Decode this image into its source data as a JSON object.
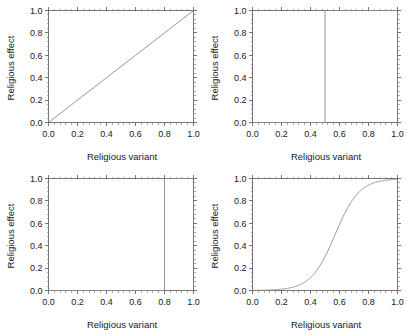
{
  "figure": {
    "background": "#ffffff",
    "line_color": "#8a8a8a",
    "axis_color": "#555555",
    "rows": 2,
    "columns": 2
  },
  "axes": {
    "xlabel": "Religious variant",
    "ylabel": "Religious effect",
    "xticklabels": [
      "0.0",
      "0.2",
      "0.4",
      "0.6",
      "0.8",
      "1.0"
    ],
    "yticklabels": [
      "0.0",
      "0.2",
      "0.4",
      "0.6",
      "0.8",
      "1.0"
    ],
    "xticks": [
      0.0,
      0.2,
      0.4,
      0.6,
      0.8,
      1.0
    ],
    "yticks": [
      0.0,
      0.2,
      0.4,
      0.6,
      0.8,
      1.0
    ],
    "xlim": [
      0.0,
      1.0
    ],
    "ylim": [
      0.0,
      1.0
    ],
    "minor_ticks_per_interval": 4,
    "tick_direction": "out",
    "frame": "full-box",
    "grid": false
  },
  "chart_data": [
    {
      "type": "line",
      "panel": "top-left",
      "title": "",
      "xlabel": "Religious variant",
      "ylabel": "Religious effect",
      "xlim": [
        0.0,
        1.0
      ],
      "ylim": [
        0.0,
        1.0
      ],
      "grid": false,
      "legend": null,
      "function": "linear",
      "description": "Identity line: effect increases linearly with variant",
      "x": [
        0.0,
        0.1,
        0.2,
        0.3,
        0.4,
        0.5,
        0.6,
        0.7,
        0.8,
        0.9,
        1.0
      ],
      "y": [
        0.0,
        0.1,
        0.2,
        0.3,
        0.4,
        0.5,
        0.6,
        0.7,
        0.8,
        0.9,
        1.0
      ]
    },
    {
      "type": "line",
      "panel": "top-right",
      "title": "",
      "xlabel": "Religious variant",
      "ylabel": "Religious effect",
      "xlim": [
        0.0,
        1.0
      ],
      "ylim": [
        0.0,
        1.0
      ],
      "grid": false,
      "legend": null,
      "function": "step",
      "description": "Step function: threshold at 0.5",
      "threshold": 0.5,
      "x": [
        0.0,
        0.5,
        0.5,
        1.0
      ],
      "y": [
        0.0,
        0.0,
        1.0,
        1.0
      ]
    },
    {
      "type": "line",
      "panel": "bottom-left",
      "title": "",
      "xlabel": "Religious variant",
      "ylabel": "Religious effect",
      "xlim": [
        0.0,
        1.0
      ],
      "ylim": [
        0.0,
        1.0
      ],
      "grid": false,
      "legend": null,
      "function": "step",
      "description": "Step function: threshold at 0.8",
      "threshold": 0.8,
      "x": [
        0.0,
        0.8,
        0.8,
        1.0
      ],
      "y": [
        0.0,
        0.0,
        1.0,
        1.0
      ]
    },
    {
      "type": "line",
      "panel": "bottom-right",
      "title": "",
      "xlabel": "Religious variant",
      "ylabel": "Religious effect",
      "xlim": [
        0.0,
        1.0
      ],
      "ylim": [
        0.0,
        1.0
      ],
      "grid": false,
      "legend": null,
      "function": "sigmoid",
      "description": "Logistic curve: midpoint 0.57, steepness 12",
      "midpoint": 0.57,
      "steepness": 12,
      "x": [
        0.0,
        0.05,
        0.1,
        0.15,
        0.2,
        0.25,
        0.3,
        0.35,
        0.4,
        0.45,
        0.5,
        0.55,
        0.6,
        0.65,
        0.7,
        0.75,
        0.8,
        0.85,
        0.9,
        0.95,
        1.0
      ],
      "y": [
        0.001,
        0.002,
        0.004,
        0.007,
        0.013,
        0.023,
        0.041,
        0.071,
        0.119,
        0.194,
        0.298,
        0.43,
        0.574,
        0.706,
        0.812,
        0.886,
        0.933,
        0.962,
        0.979,
        0.988,
        0.993
      ]
    }
  ]
}
